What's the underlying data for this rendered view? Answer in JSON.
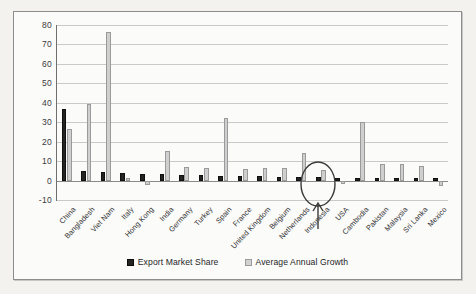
{
  "chart_data": {
    "type": "bar",
    "title": "",
    "subtitle": "",
    "xlabel": "",
    "ylabel": "",
    "ylim": [
      -10,
      80
    ],
    "yticks": [
      80,
      70,
      60,
      50,
      40,
      30,
      20,
      10,
      0,
      -10
    ],
    "grid": true,
    "legend_position": "bottom",
    "categories": [
      "China",
      "Bangladesh",
      "Viet Nam",
      "Italy",
      "Hong Kong",
      "India",
      "Germany",
      "Turkey",
      "Spain",
      "France",
      "United Kingdom",
      "Belgium",
      "Netherlands",
      "Indonesia",
      "USA",
      "Cambodia",
      "Pakistan",
      "Malaysia",
      "Sri Lanka",
      "Mexico"
    ],
    "series": [
      {
        "name": "Export Market Share",
        "color": "#242424",
        "values": [
          37,
          5,
          4.5,
          4,
          3.5,
          3.5,
          3,
          3,
          2.5,
          2.5,
          2.5,
          2,
          2,
          2,
          1.5,
          1.5,
          1.5,
          1.5,
          1.5,
          1.5
        ]
      },
      {
        "name": "Average Annual Growth",
        "color": "#cfcfcf",
        "values": [
          26.5,
          39.5,
          76.5,
          1.5,
          -2.5,
          15,
          7,
          6.5,
          32,
          6,
          6.5,
          6.5,
          14,
          5.5,
          -2,
          30,
          8.5,
          8.5,
          7.5,
          -3
        ]
      }
    ]
  },
  "legend": {
    "entries": [
      {
        "label": "Export Market Share",
        "swatch": "dark"
      },
      {
        "label": "Average Annual Growth",
        "swatch": "light"
      }
    ]
  },
  "annotation": {
    "shape": "ellipse-with-arrow",
    "target_category": "Indonesia"
  }
}
